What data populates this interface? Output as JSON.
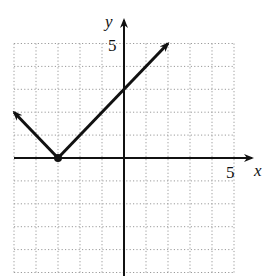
{
  "chart_data": {
    "type": "line",
    "title": "",
    "xlabel": "x",
    "ylabel": "y",
    "xlim": [
      -5,
      5
    ],
    "ylim": [
      -5,
      5
    ],
    "grid": true,
    "grid_style": "dotted",
    "tick_labels": {
      "x": [
        "5"
      ],
      "y": [
        "5"
      ]
    },
    "series": [
      {
        "name": "y = |x + 3|",
        "points": [
          {
            "x": -5,
            "y": 2
          },
          {
            "x": -3,
            "y": 0
          },
          {
            "x": 2,
            "y": 5
          }
        ],
        "vertex": {
          "x": -3,
          "y": 0
        },
        "arrow_ends": true,
        "color": "#111111"
      }
    ]
  },
  "labels": {
    "x_axis": "x",
    "y_axis": "y",
    "x_tick": "5",
    "y_tick": "5"
  },
  "colors": {
    "axis": "#111111",
    "grid": "#9a9a9a",
    "curve": "#111111",
    "background": "#ffffff"
  }
}
